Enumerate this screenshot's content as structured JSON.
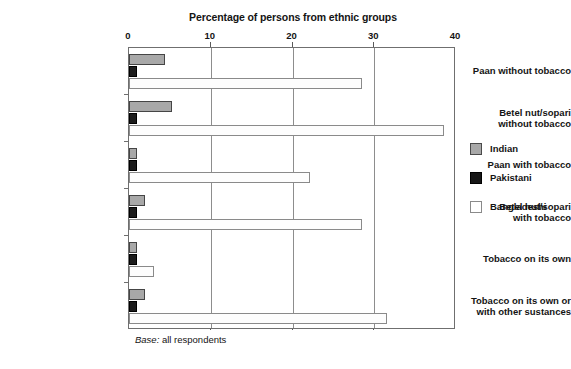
{
  "chart_data": {
    "type": "bar",
    "orientation": "horizontal",
    "title": "Percentage of persons from ethnic groups",
    "xlabel": "",
    "ylabel": "",
    "xlim": [
      0,
      40
    ],
    "xticks": [
      0,
      10,
      20,
      30,
      40
    ],
    "xtick_labels": [
      "0",
      "10",
      "20",
      "30",
      "40"
    ],
    "grid": true,
    "grid_axis": "x",
    "legend_position": "right",
    "categories": [
      "Paan without tobacco",
      "Betel nut/sopari\nwithout tobacco",
      "Paan with tobacco",
      "Betel nut/sopari\nwith tobacco",
      "Tobacco on its own",
      "Tobacco on its own or\nwith other sustances"
    ],
    "series": [
      {
        "name": "Indian",
        "color": "#a8a8a8",
        "values": [
          4.4,
          5.2,
          1.0,
          2.0,
          1.0,
          2.0
        ]
      },
      {
        "name": "Pakistani",
        "color": "#1c1c1c",
        "values": [
          1.0,
          1.0,
          1.0,
          1.0,
          1.0,
          1.0
        ]
      },
      {
        "name": "Bangladeshi",
        "color": "#ffffff",
        "values": [
          28.5,
          38.5,
          22.2,
          28.5,
          3.0,
          31.5
        ]
      }
    ],
    "base_note_emphasis": "Base:",
    "base_note_text": " all respondents"
  },
  "categories": [
    {
      "label_line1": "Paan without tobacco",
      "label_line2": ""
    },
    {
      "label_line1": "Betel nut/sopari",
      "label_line2": "without tobacco"
    },
    {
      "label_line1": "Paan with tobacco",
      "label_line2": ""
    },
    {
      "label_line1": "Betel nut/sopari",
      "label_line2": "with tobacco"
    },
    {
      "label_line1": "Tobacco on its own",
      "label_line2": ""
    },
    {
      "label_line1": "Tobacco on its own or",
      "label_line2": "with other sustances"
    }
  ],
  "legend": {
    "items": [
      {
        "label": "Indian"
      },
      {
        "label": "Pakistani"
      },
      {
        "label": "Bangladeshi"
      }
    ]
  },
  "axis": {
    "tick_labels": [
      "0",
      "10",
      "20",
      "30",
      "40"
    ]
  },
  "notes": {
    "base_label": "Base:",
    "base_value": " all respondents",
    "caption": ""
  }
}
